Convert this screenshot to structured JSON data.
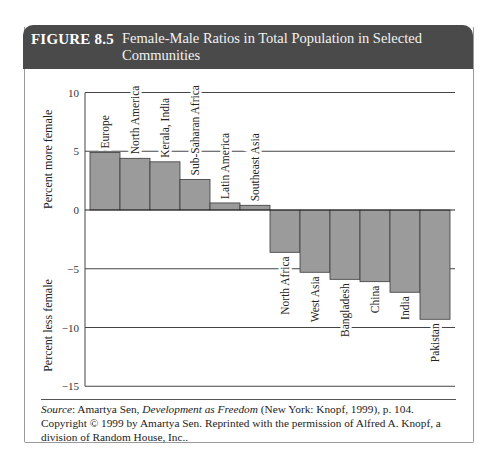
{
  "figure": {
    "number": "FIGURE 8.5",
    "title": "Female-Male Ratios in Total Population in Selected Communities",
    "colors": {
      "header_bg": "#4a4a4a",
      "header_text": "#ffffff",
      "bar_fill": "#9b9b9b",
      "bar_stroke": "#3a3a3a",
      "gridline": "#444444"
    }
  },
  "chart_data": {
    "type": "bar",
    "title": "Female-Male Ratios in Total Population in Selected Communities",
    "xlabel": "",
    "ylabel_positive": "Percent more female",
    "ylabel_negative": "Percent less female",
    "ylim": [
      -15,
      10
    ],
    "yticks": [
      10,
      5,
      0,
      -5,
      -10,
      -15
    ],
    "ytick_labels": [
      "10",
      "5",
      "0",
      "−5",
      "−10",
      "−15"
    ],
    "grid": true,
    "legend": null,
    "categories": [
      "Europe",
      "North America",
      "Kerala, India",
      "Sub-Saharan Africa",
      "Latin America",
      "Southeast Asia",
      "North Africa",
      "West Asia",
      "Bangladesh",
      "China",
      "India",
      "Pakistan"
    ],
    "values": [
      4.9,
      4.4,
      4.1,
      2.6,
      0.6,
      0.4,
      -3.6,
      -5.3,
      -5.9,
      -6.1,
      -7.0,
      -9.3
    ]
  },
  "source": {
    "label": "Source",
    "author": "Amartya Sen, ",
    "book": "Development as Freedom",
    "rest": " (New York: Knopf, 1999), p. 104. Copyright © 1999 by Amartya Sen. Reprinted with the permission of Alfred A. Knopf, a division of Random House, Inc.."
  }
}
